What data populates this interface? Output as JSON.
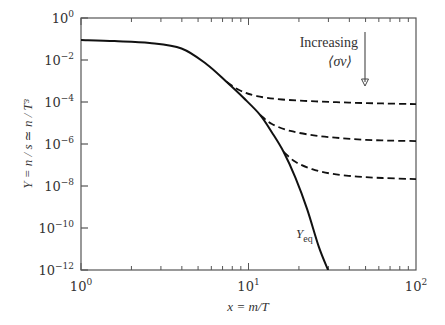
{
  "chart_data": {
    "type": "line",
    "title": "",
    "xlabel": "x = m/T",
    "ylabel": "Y = n / s ≃ n / T³",
    "xscale": "log",
    "yscale": "log",
    "xlim": [
      1,
      100
    ],
    "ylim": [
      1e-12,
      1
    ],
    "grid": false,
    "legend": null,
    "x_ticks": [
      {
        "base": "10",
        "exp": "0",
        "value": 1
      },
      {
        "base": "10",
        "exp": "1",
        "value": 10
      },
      {
        "base": "10",
        "exp": "2",
        "value": 100
      }
    ],
    "y_ticks": [
      {
        "base": "10",
        "exp": "0",
        "value": 1
      },
      {
        "base": "10",
        "exp": "−2",
        "value": 0.01
      },
      {
        "base": "10",
        "exp": "−4",
        "value": 0.0001
      },
      {
        "base": "10",
        "exp": "−6",
        "value": 1e-06
      },
      {
        "base": "10",
        "exp": "−8",
        "value": 1e-08
      },
      {
        "base": "10",
        "exp": "−10",
        "value": 1e-10
      },
      {
        "base": "10",
        "exp": "−12",
        "value": 1e-12
      }
    ],
    "series": [
      {
        "name": "Y_eq",
        "style": "solid",
        "label": "Y",
        "label_sub": "eq",
        "points_log10": [
          [
            0.0,
            -1.05
          ],
          [
            0.2,
            -1.1
          ],
          [
            0.41,
            -1.19
          ],
          [
            0.6,
            -1.45
          ],
          [
            0.75,
            -2.2
          ],
          [
            0.87,
            -3.05
          ],
          [
            0.97,
            -3.8
          ],
          [
            1.07,
            -4.62
          ],
          [
            1.14,
            -5.45
          ],
          [
            1.21,
            -6.38
          ],
          [
            1.28,
            -7.6
          ],
          [
            1.35,
            -9.1
          ],
          [
            1.42,
            -10.9
          ],
          [
            1.475,
            -12.0
          ]
        ]
      },
      {
        "name": "freeze-out (small <σv>)",
        "style": "dashed",
        "points_log10": [
          [
            0.87,
            -3.05
          ],
          [
            0.95,
            -3.45
          ],
          [
            1.05,
            -3.72
          ],
          [
            1.2,
            -3.88
          ],
          [
            1.4,
            -3.97
          ],
          [
            1.6,
            -4.03
          ],
          [
            1.8,
            -4.07
          ],
          [
            2.0,
            -4.1
          ]
        ]
      },
      {
        "name": "freeze-out (medium <σv>)",
        "style": "dashed",
        "points_log10": [
          [
            1.07,
            -4.62
          ],
          [
            1.14,
            -5.05
          ],
          [
            1.25,
            -5.38
          ],
          [
            1.4,
            -5.6
          ],
          [
            1.55,
            -5.72
          ],
          [
            1.7,
            -5.8
          ],
          [
            1.85,
            -5.84
          ],
          [
            2.0,
            -5.86
          ]
        ]
      },
      {
        "name": "freeze-out (large <σv>)",
        "style": "dashed",
        "points_log10": [
          [
            1.21,
            -6.38
          ],
          [
            1.28,
            -6.85
          ],
          [
            1.38,
            -7.2
          ],
          [
            1.5,
            -7.42
          ],
          [
            1.65,
            -7.55
          ],
          [
            1.8,
            -7.62
          ],
          [
            2.0,
            -7.67
          ]
        ]
      }
    ],
    "annotations": [
      {
        "text": "Increasing",
        "type": "label"
      },
      {
        "text": "⟨σv⟩",
        "type": "label"
      },
      {
        "type": "arrow",
        "direction": "down",
        "meaning": "increasing <σv> lowers relic abundance"
      }
    ]
  },
  "labels": {
    "xlabel": "x = m/T",
    "ylabel": "Y = n / s ≃ n / T³",
    "annot_line1": "Increasing",
    "annot_line2": "⟨σv⟩",
    "yeq_main": "Y",
    "yeq_sub": "eq"
  }
}
